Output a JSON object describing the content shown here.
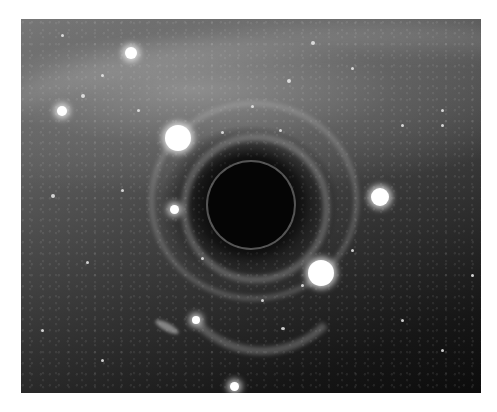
{
  "image": {
    "subject": "simulated black hole with gravitational lensing of a starfield",
    "description": "Grayscale rendering of a black hole in front of a galactic starfield; the galactic band is bent into arcs and Einstein-ring-like rings surround the dark central shadow.",
    "frame": {
      "x": 21,
      "y": 19,
      "width": 460,
      "height": 374,
      "border_color": "#ffffff"
    },
    "palette": {
      "background_bright": "#8a8a8a",
      "background_dark": "#0c0c0c",
      "shadow": "#050505",
      "star": "#ffffff"
    },
    "features": {
      "black_hole": {
        "center": [
          250,
          205
        ],
        "radius": 43
      },
      "bright_stars": [
        {
          "center": [
            178,
            138
          ],
          "radius": 13
        },
        {
          "center": [
            321,
            273
          ],
          "radius": 13
        },
        {
          "center": [
            380,
            197
          ],
          "radius": 9
        },
        {
          "center": [
            131,
            53
          ],
          "radius": 6
        },
        {
          "center": [
            62,
            111
          ],
          "radius": 5
        },
        {
          "center": [
            175,
            210
          ],
          "radius": 5
        },
        {
          "center": [
            235,
            386
          ],
          "radius": 5
        },
        {
          "center": [
            196,
            320
          ],
          "radius": 4
        }
      ],
      "small_galaxy": {
        "center": [
          164,
          332
        ],
        "angle_deg": 28
      },
      "lensing_arcs": [
        "upper arc above shadow",
        "inner ring hugging shadow",
        "lower arc below shadow"
      ]
    }
  }
}
